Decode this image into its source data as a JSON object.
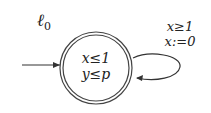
{
  "automaton": {
    "location": {
      "name": "ℓ0",
      "name_base": "ℓ",
      "name_sub": "0",
      "invariant": [
        "x≤1",
        "y≤p"
      ],
      "initial": true,
      "accepting": true
    },
    "self_loop": {
      "guard": "x≥1",
      "reset": "x:=0"
    }
  }
}
